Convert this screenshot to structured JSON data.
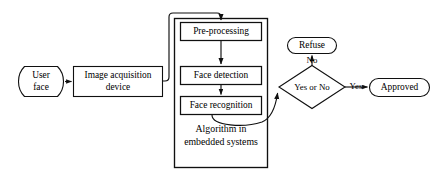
{
  "diagram": {
    "background_color": "#ffffff",
    "line_color": "#101010",
    "text_color": "#000000",
    "nodes": {
      "user_face": {
        "line1": "User",
        "line2": "face",
        "shape": "punched-tape"
      },
      "image_acquisition": {
        "line1": "Image acquisition",
        "line2": "device",
        "shape": "rectangle"
      },
      "pre_processing": {
        "label": "Pre-processing",
        "shape": "rectangle"
      },
      "face_detection": {
        "label": "Face detection",
        "shape": "rectangle"
      },
      "face_recognition": {
        "label": "Face recognition",
        "shape": "rectangle"
      },
      "algorithm_caption": {
        "line1": "Algorithm in",
        "line2": "embedded systems",
        "shape": "text"
      },
      "decision": {
        "label": "Yes or No",
        "shape": "diamond"
      },
      "refuse": {
        "label": "Refuse",
        "shape": "stadium"
      },
      "approved": {
        "label": "Approved",
        "shape": "stadium"
      }
    },
    "edge_labels": {
      "decision_no": "No",
      "decision_yes": "Yes"
    }
  }
}
